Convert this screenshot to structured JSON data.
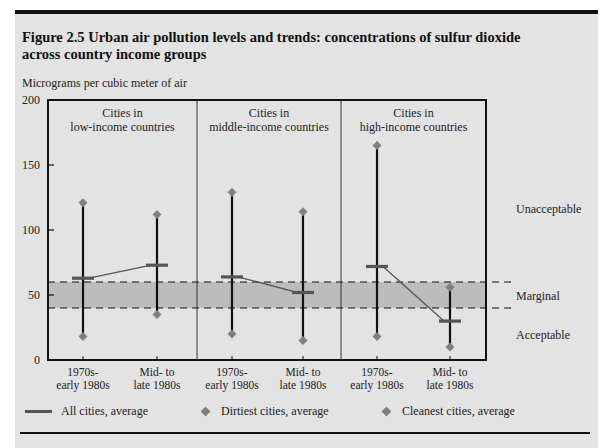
{
  "figure": {
    "title": "Figure 2.5  Urban air pollution levels and trends: concentrations of sulfur dioxide across country income groups",
    "ylabel": "Micrograms per cubic meter of air"
  },
  "zones": {
    "unacceptable": "Unacceptable",
    "marginal": "Marginal",
    "acceptable": "Acceptable"
  },
  "groups": [
    {
      "label_line1": "Cities in",
      "label_line2": "low-income countries"
    },
    {
      "label_line1": "Cities in",
      "label_line2": "middle-income countries"
    },
    {
      "label_line1": "Cities in",
      "label_line2": "high-income countries"
    }
  ],
  "periods": [
    {
      "line1": "1970s-",
      "line2": "early 1980s"
    },
    {
      "line1": "Mid- to",
      "line2": "late 1980s"
    },
    {
      "line1": "1970s-",
      "line2": "early 1980s"
    },
    {
      "line1": "Mid- to",
      "line2": "late 1980s"
    },
    {
      "line1": "1970s-",
      "line2": "early 1980s"
    },
    {
      "line1": "Mid- to",
      "line2": "late 1980s"
    }
  ],
  "yticks": [
    "0",
    "50",
    "100",
    "150",
    "200"
  ],
  "legend": {
    "average": "All cities, average",
    "dirtiest": "Dirtiest cities, average",
    "cleanest": "Cleanest cities, average"
  },
  "colors": {
    "average": "#555555",
    "diamond": "#808080",
    "band": "#bcbcbc",
    "panel": "#e3e3e3"
  },
  "chart_data": {
    "type": "line",
    "title": "Figure 2.5 Urban air pollution levels and trends: concentrations of sulfur dioxide across country income groups",
    "xlabel": "",
    "ylabel": "Micrograms per cubic meter of air",
    "ylim": [
      0,
      200
    ],
    "yticks": [
      0,
      50,
      100,
      150,
      200
    ],
    "grid": false,
    "legend_position": "bottom",
    "groups": [
      "Cities in low-income countries",
      "Cities in middle-income countries",
      "Cities in high-income countries"
    ],
    "categories": [
      "1970s-early 1980s",
      "Mid- to late 1980s",
      "1970s-early 1980s",
      "Mid- to late 1980s",
      "1970s-early 1980s",
      "Mid- to late 1980s"
    ],
    "series": [
      {
        "name": "All cities, average",
        "values": [
          63,
          73,
          64,
          52,
          72,
          30
        ]
      },
      {
        "name": "Dirtiest cities, average",
        "values": [
          121,
          112,
          129,
          114,
          165,
          56
        ]
      },
      {
        "name": "Cleanest cities, average",
        "values": [
          18,
          35,
          20,
          15,
          18,
          10
        ]
      }
    ],
    "reference_bands": [
      {
        "label": "Unacceptable",
        "range": [
          60,
          200
        ]
      },
      {
        "label": "Marginal",
        "range": [
          40,
          60
        ],
        "shaded": true
      },
      {
        "label": "Acceptable",
        "range": [
          0,
          40
        ]
      }
    ]
  }
}
